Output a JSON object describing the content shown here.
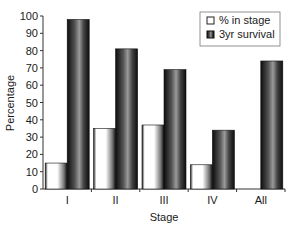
{
  "chart_data": {
    "type": "bar",
    "title": "",
    "xlabel": "Stage",
    "ylabel": "Percentage",
    "categories": [
      "I",
      "II",
      "III",
      "IV",
      "All"
    ],
    "series": [
      {
        "name": "% in stage",
        "values": [
          15,
          35,
          37,
          14,
          null
        ],
        "style": "light-gradient"
      },
      {
        "name": "3yr survival",
        "values": [
          98,
          81,
          69,
          34,
          74
        ],
        "style": "dark-gradient"
      }
    ],
    "ylim": [
      0,
      100
    ],
    "yticks": [
      0,
      10,
      20,
      30,
      40,
      50,
      60,
      70,
      80,
      90,
      100
    ],
    "grid": false,
    "legend_position": "top-right"
  },
  "colors": {
    "light_bar_edge": "#ffffff",
    "light_bar_mid": "#1a1a1a",
    "dark_bar_edge": "#111111",
    "dark_bar_mid": "#9a9a9a",
    "axis": "#333333"
  }
}
